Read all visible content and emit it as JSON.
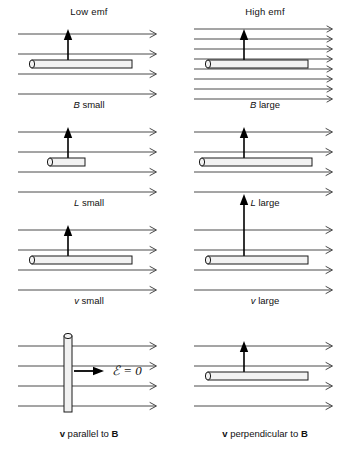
{
  "figure": {
    "width": 354,
    "height": 461,
    "background": "#ffffff",
    "line_color": "#4a4a4a",
    "rod_fill": "#f2f2f2",
    "rod_stroke": "#1a1a1a",
    "arrow_color": "#000000",
    "text_color": "#111111"
  },
  "columns": {
    "left_header": "Low emf",
    "right_header": "High emf"
  },
  "rows": [
    {
      "id": "row-b",
      "variable": "B",
      "left": {
        "caption_symbol": "B",
        "caption_text": "small",
        "field_lines": 4,
        "field_line_spacing": 20,
        "rod_orientation": "horizontal",
        "rod_length": 100,
        "velocity_arrow_length": 30
      },
      "right": {
        "caption_symbol": "B",
        "caption_text": "large",
        "field_lines": 8,
        "field_line_spacing": 10,
        "rod_orientation": "horizontal",
        "rod_length": 100,
        "velocity_arrow_length": 30
      }
    },
    {
      "id": "row-l",
      "variable": "L",
      "left": {
        "caption_symbol": "L",
        "caption_text": "small",
        "field_lines": 4,
        "field_line_spacing": 20,
        "rod_orientation": "horizontal",
        "rod_length": 35,
        "velocity_arrow_length": 30
      },
      "right": {
        "caption_symbol": "L",
        "caption_text": "large",
        "field_lines": 4,
        "field_line_spacing": 20,
        "rod_orientation": "horizontal",
        "rod_length": 110,
        "velocity_arrow_length": 30
      }
    },
    {
      "id": "row-v",
      "variable": "v",
      "left": {
        "caption_symbol": "v",
        "caption_text": "small",
        "field_lines": 4,
        "field_line_spacing": 20,
        "rod_orientation": "horizontal",
        "rod_length": 100,
        "velocity_arrow_length": 30
      },
      "right": {
        "caption_symbol": "v",
        "caption_text": "large",
        "field_lines": 4,
        "field_line_spacing": 20,
        "rod_orientation": "horizontal",
        "rod_length": 100,
        "velocity_arrow_length": 62
      }
    },
    {
      "id": "row-orientation",
      "variable": "orientation",
      "left": {
        "caption_symbol": "",
        "caption_text": "",
        "field_lines": 4,
        "field_line_spacing": 20,
        "rod_orientation": "vertical",
        "rod_length": 78,
        "velocity_arrow_length": 30,
        "velocity_arrow_direction": "right",
        "emf_label": "ℰ = 0"
      },
      "right": {
        "caption_symbol": "",
        "caption_text": "",
        "field_lines": 4,
        "field_line_spacing": 20,
        "rod_orientation": "horizontal",
        "rod_length": 100,
        "velocity_arrow_length": 30
      }
    }
  ],
  "footers": {
    "left": {
      "vector_v": "v",
      "middle": " parallel to ",
      "vector_b": "B"
    },
    "right": {
      "vector_v": "v",
      "middle": " perpendicular to ",
      "vector_b": "B"
    }
  }
}
